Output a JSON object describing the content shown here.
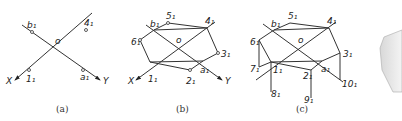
{
  "figures": [
    {
      "id": "a",
      "caption": "(a)",
      "labels": {
        "b1": "b₁",
        "f1": "4₁",
        "o": "o",
        "x": "X",
        "y": "Y",
        "one": "1₁",
        "a1": "a₁"
      }
    },
    {
      "id": "b",
      "caption": "(b)",
      "labels": {
        "b1": "b₁",
        "five": "5₁",
        "f1": "4₁",
        "six": "6₁",
        "o": "o",
        "three": "3₁",
        "x": "X",
        "y": "Y",
        "one": "1₁",
        "two": "2₁",
        "a1": "a₁"
      }
    },
    {
      "id": "c",
      "caption": "(c)",
      "labels": {
        "b1": "b₁",
        "five": "5₁",
        "f1": "4₁",
        "six": "6₁",
        "o": "o",
        "three": "3₁",
        "seven": "7₁",
        "one": "1₁",
        "two": "2₁",
        "a1": "a₁",
        "eight": "8₁",
        "nine": "9₁",
        "ten": "10₁"
      }
    }
  ],
  "colors": {
    "line": "#333333",
    "background": "#ffffff"
  }
}
